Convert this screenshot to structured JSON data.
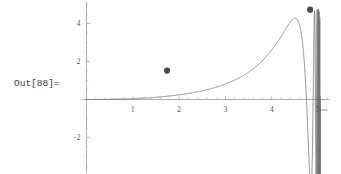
{
  "cell": {
    "out_label": "Out[88]=",
    "background_color": "#ffffff",
    "label_color": "#3a3a3a"
  },
  "chart_data": {
    "type": "line",
    "title": "",
    "subtitle": "",
    "xlabel": "",
    "ylabel": "",
    "grid": false,
    "legend": false,
    "legend_position": "none",
    "xlim": [
      -0.1,
      5.25
    ],
    "ylim": [
      -3.6,
      5.1
    ],
    "x_ticks": [
      1,
      2,
      3,
      4,
      5
    ],
    "x_tick_labels": [
      "1",
      "2",
      "3",
      "4",
      "5"
    ],
    "y_ticks": [
      -2,
      2,
      4
    ],
    "y_tick_labels": [
      "-2",
      "2",
      "4"
    ],
    "x_minor_tick_step": 0.2,
    "y_minor_tick_step": 0.5,
    "axis_color": "#8c8c8c",
    "curve_color": "#737373",
    "marker_color": "#4a4a4a",
    "series": [
      {
        "name": "chirp",
        "description": "increasing-frequency oscillation with growing amplitude",
        "formula": "x*sin(1/(5.05-x))",
        "x_start": 0,
        "x_end": 5.2,
        "samples": 4000
      }
    ],
    "markers": [
      {
        "name": "first-maximum",
        "x": 1.74,
        "y": 1.52
      },
      {
        "name": "last-maximum",
        "x": 4.83,
        "y": 4.73
      }
    ],
    "notable_extrema": [
      {
        "x": 1.74,
        "y": 1.52
      },
      {
        "x": 2.52,
        "y": -0.55
      },
      {
        "x": 2.93,
        "y": 0.55
      },
      {
        "x": 3.3,
        "y": -2.52
      },
      {
        "x": 3.62,
        "y": 3.3
      },
      {
        "x": 4.23,
        "y": 4.1
      },
      {
        "x": 4.58,
        "y": 4.55
      },
      {
        "x": 4.83,
        "y": 4.73
      }
    ]
  }
}
